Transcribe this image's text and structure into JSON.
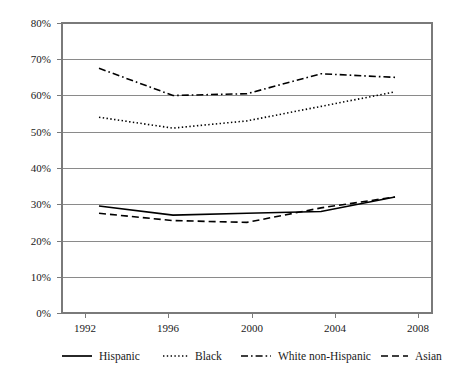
{
  "chart_data": {
    "type": "line",
    "title": "",
    "subtitle": "",
    "xlabel": "",
    "ylabel": "",
    "x": [
      1992,
      1996,
      2000,
      2004,
      2008
    ],
    "categories": [
      "1992",
      "1996",
      "2000",
      "2004",
      "2008"
    ],
    "xtick_labels": [
      "1992",
      "1996",
      "2000",
      "2004",
      "2008"
    ],
    "ytick_labels": [
      "0%",
      "10%",
      "20%",
      "30%",
      "40%",
      "50%",
      "60%",
      "70%",
      "80%"
    ],
    "ytick_values": [
      0,
      10,
      20,
      30,
      40,
      50,
      60,
      70,
      80
    ],
    "ylim": [
      0,
      80
    ],
    "xlim": [
      1990,
      2010
    ],
    "grid": "horizontal",
    "legend_position": "bottom",
    "series": [
      {
        "name": "Hispanic",
        "dash_style": "solid",
        "values": [
          29.5,
          27,
          27.5,
          28,
          32
        ]
      },
      {
        "name": "Black",
        "dash_style": "dotted",
        "values": [
          54,
          51,
          53,
          57,
          61
        ]
      },
      {
        "name": "White non-Hispanic",
        "dash_style": "dash-dot",
        "values": [
          67.5,
          60,
          60.5,
          66,
          65
        ]
      },
      {
        "name": "Asian",
        "dash_style": "dashed",
        "values": [
          27.5,
          25.5,
          25,
          29,
          32
        ]
      }
    ]
  },
  "legend": {
    "items": [
      {
        "label": "Hispanic",
        "style": "solid"
      },
      {
        "label": "Black",
        "style": "dotted"
      },
      {
        "label": "White non-Hispanic",
        "style": "dash-dot"
      },
      {
        "label": "Asian",
        "style": "dashed"
      }
    ]
  },
  "colors": {
    "line": "#000000",
    "grid": "#8a8a8a",
    "frame": "#7a7a7a",
    "text": "#1a1a1a",
    "background": "#ffffff"
  }
}
